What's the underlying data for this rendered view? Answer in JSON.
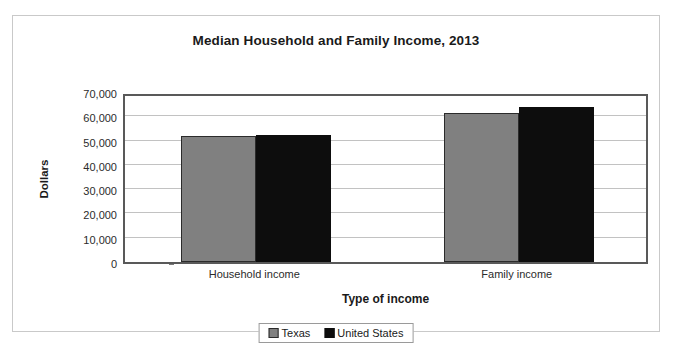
{
  "chart_data": {
    "type": "bar",
    "title": "Median Household and Family Income, 2013",
    "xlabel": "Type of income",
    "ylabel": "Dollars",
    "categories": [
      "Household income",
      "Family income"
    ],
    "series": [
      {
        "name": "Texas",
        "color": "#808080",
        "values": [
          51700,
          61400
        ]
      },
      {
        "name": "United States",
        "color": "#0d0d0d",
        "values": [
          52300,
          64000
        ]
      }
    ],
    "ylim": [
      0,
      70000
    ],
    "ytick_step": 10000,
    "ytick_labels": [
      "0",
      "10,000",
      "20,000",
      "30,000",
      "40,000",
      "50,000",
      "60,000",
      "70,000"
    ],
    "ytick_values": [
      0,
      10000,
      20000,
      30000,
      40000,
      50000,
      60000,
      70000
    ],
    "grid": true,
    "legend_position": "bottom"
  }
}
